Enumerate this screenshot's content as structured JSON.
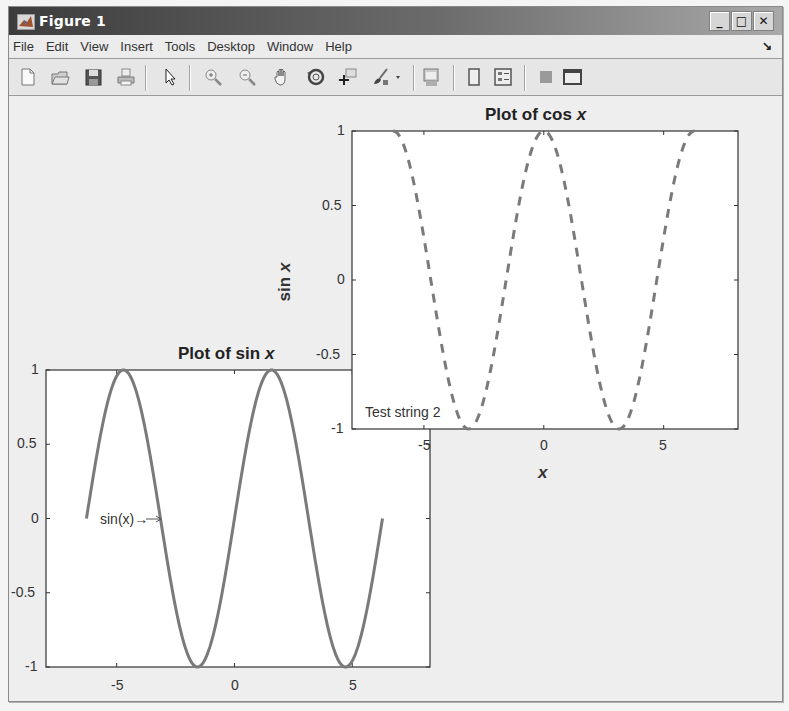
{
  "window": {
    "title": "Figure 1",
    "controls": {
      "minimize": "_",
      "maximize": "□",
      "close": "✕"
    }
  },
  "menubar": {
    "items": [
      "File",
      "Edit",
      "View",
      "Insert",
      "Tools",
      "Desktop",
      "Window",
      "Help"
    ],
    "dock_arrow": "↘"
  },
  "toolbar": {
    "buttons": [
      {
        "name": "new-figure-icon"
      },
      {
        "name": "open-file-icon"
      },
      {
        "name": "save-figure-icon"
      },
      {
        "name": "print-figure-icon"
      },
      {
        "name": "edit-plot-arrow-icon"
      },
      {
        "name": "zoom-in-icon"
      },
      {
        "name": "zoom-out-icon"
      },
      {
        "name": "pan-hand-icon"
      },
      {
        "name": "rotate-3d-icon"
      },
      {
        "name": "data-cursor-icon"
      },
      {
        "name": "brush-icon"
      },
      {
        "name": "brush-dropdown-icon"
      },
      {
        "name": "link-plot-icon"
      },
      {
        "name": "insert-colorbar-icon"
      },
      {
        "name": "insert-legend-icon"
      },
      {
        "name": "hide-plot-tools-icon"
      },
      {
        "name": "show-plot-tools-icon"
      }
    ]
  },
  "colors": {
    "line": "#7a7a7a",
    "axes_bg": "#ffffff",
    "figure_bg": "#eeeeee",
    "axis": "#333333"
  },
  "chart_data": [
    {
      "type": "line",
      "title": "Plot of sin x",
      "title_plain": "Plot of sin ",
      "title_italic": "x",
      "xlabel": "",
      "ylabel": "",
      "xlim": [
        -8,
        8.3
      ],
      "ylim": [
        -1,
        1
      ],
      "xticks": [
        -5,
        0,
        5
      ],
      "xtick_labels": [
        "-5",
        "0",
        "5"
      ],
      "yticks": [
        -1,
        -0.5,
        0,
        0.5,
        1
      ],
      "ytick_labels": [
        "-1",
        "-0.5",
        "0",
        "0.5",
        "1"
      ],
      "grid": false,
      "series": [
        {
          "name": "sin(x)",
          "function": "sin",
          "x_range": [
            -6.2832,
            6.2832
          ],
          "style": "solid",
          "linewidth": 3,
          "color": "#7a7a7a"
        }
      ],
      "annotations": [
        {
          "text": "sin(x)→",
          "x": -3.14,
          "y": 0
        }
      ],
      "box": {
        "left": 46,
        "top": 370,
        "right": 430,
        "bottom": 667
      }
    },
    {
      "type": "line",
      "title": "Plot of cos x",
      "title_plain": "Plot of cos ",
      "title_italic": "x",
      "xlabel": "x",
      "ylabel": "sin x",
      "ylabel_plain": "sin ",
      "ylabel_italic": "x",
      "xlim": [
        -8,
        8.1
      ],
      "ylim": [
        -1,
        1
      ],
      "xticks": [
        -5,
        0,
        5
      ],
      "xtick_labels": [
        "-5",
        "0",
        "5"
      ],
      "yticks": [
        -1,
        -0.5,
        0,
        0.5,
        1
      ],
      "ytick_labels": [
        "-1",
        "-0.5",
        "0",
        "0.5",
        "1"
      ],
      "grid": false,
      "series": [
        {
          "name": "cos(x)",
          "function": "cos",
          "x_range": [
            -6.2832,
            6.2832
          ],
          "style": "dashed",
          "linewidth": 3,
          "color": "#7a7a7a"
        }
      ],
      "annotations": [
        {
          "text": "Test string 2",
          "x": -7.6,
          "y": -0.92
        }
      ],
      "box": {
        "left": 352,
        "top": 131,
        "right": 738,
        "bottom": 429
      }
    }
  ]
}
